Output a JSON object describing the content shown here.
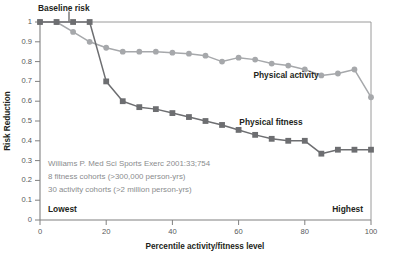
{
  "chart_data": {
    "type": "line",
    "title": "",
    "xlabel": "Percentile activity/fitness level",
    "ylabel": "Risk Reduction",
    "xlim": [
      0,
      100
    ],
    "ylim": [
      0,
      1
    ],
    "grid": false,
    "legend_position": "inline-annotation",
    "xticks": [
      0,
      20,
      40,
      60,
      80,
      100
    ],
    "xticklabels": [
      "0",
      "20",
      "40",
      "60",
      "80",
      "100"
    ],
    "yticks": [
      0,
      0.1,
      0.2,
      0.3,
      0.4,
      0.5,
      0.6,
      0.7,
      0.8,
      0.9,
      1
    ],
    "yticklabels": [
      "0",
      "0.1",
      "0.2",
      "0.3",
      "0.4",
      "0.5",
      "0.6",
      "0.7",
      "0.8",
      "0.9",
      "1"
    ],
    "series": [
      {
        "name": "Physical activity",
        "color": "#a6a8ab",
        "marker": "circle",
        "x": [
          0,
          5,
          10,
          15,
          20,
          25,
          30,
          35,
          40,
          45,
          50,
          55,
          60,
          65,
          70,
          75,
          80,
          85,
          90,
          95,
          100
        ],
        "values": [
          1.0,
          1.0,
          0.95,
          0.9,
          0.87,
          0.85,
          0.85,
          0.85,
          0.845,
          0.84,
          0.83,
          0.8,
          0.82,
          0.81,
          0.79,
          0.78,
          0.76,
          0.73,
          0.74,
          0.76,
          0.62
        ]
      },
      {
        "name": "Physical fitness",
        "color": "#6d6e71",
        "marker": "square",
        "x": [
          0,
          5,
          10,
          15,
          20,
          25,
          30,
          35,
          40,
          45,
          50,
          55,
          60,
          65,
          70,
          75,
          80,
          85,
          90,
          95,
          100
        ],
        "values": [
          1.0,
          1.0,
          1.0,
          1.0,
          0.7,
          0.6,
          0.57,
          0.56,
          0.54,
          0.52,
          0.5,
          0.48,
          0.455,
          0.43,
          0.41,
          0.4,
          0.4,
          0.335,
          0.355,
          0.355,
          0.355
        ]
      }
    ],
    "annotations": {
      "baseline": "Baseline risk",
      "lowest": "Lowest",
      "highest": "Highest",
      "source_lines": [
        "Williams P. Med Sci Sports Exerc 2001:33;754",
        "8 fitness cohorts (>300,000 person-yrs)",
        "30 activity cohorts (>2 million person-yrs)"
      ]
    },
    "series_labels": [
      {
        "text": "Physical activity",
        "x": 62,
        "y": 0.855
      },
      {
        "text": "Physical fitness",
        "x": 58,
        "y": 0.5
      }
    ]
  },
  "colors": {
    "activity": "#a6a8ab",
    "fitness": "#6d6e71",
    "axis": "#808080",
    "text": "#231f20",
    "source": "#8a8c8e",
    "background": "#ffffff"
  }
}
